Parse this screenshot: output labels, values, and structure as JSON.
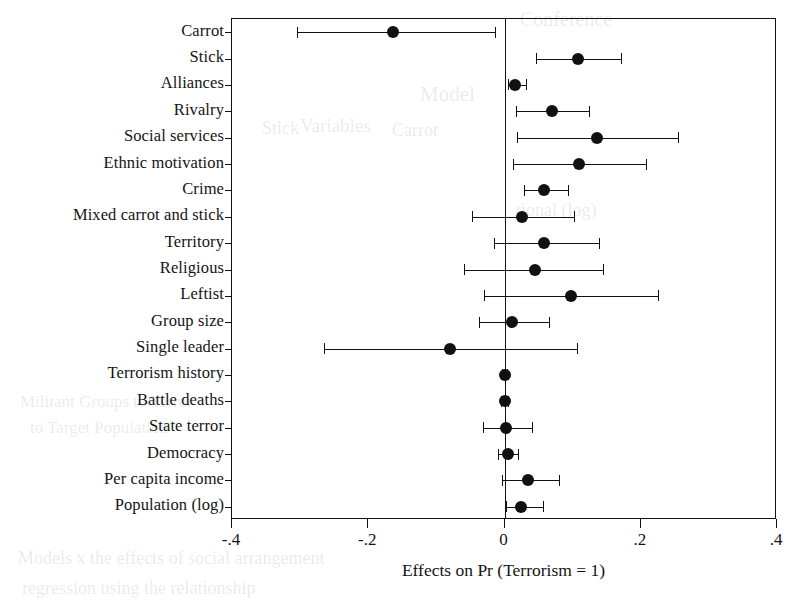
{
  "chart_data": {
    "type": "scatter",
    "title": "",
    "subtitle": "",
    "xlabel": "Effects on Pr (Terrorism = 1)",
    "ylabel": "",
    "xlim": [
      -0.4,
      0.4
    ],
    "xticks": [
      -0.4,
      -0.2,
      0,
      0.2,
      0.4
    ],
    "xticklabels": [
      "-.4",
      "-.2",
      "0",
      ".2",
      ".4"
    ],
    "grid": false,
    "legend": null,
    "reference_line": 0,
    "marker": "filled-circle",
    "error_bars": "95% confidence interval with end caps",
    "categories": [
      "Carrot",
      "Stick",
      "Alliances",
      "Rivalry",
      "Social services",
      "Ethnic motivation",
      "Crime",
      "Mixed carrot and stick",
      "Territory",
      "Religious",
      "Leftist",
      "Group size",
      "Single leader",
      "Terrorism history",
      "Battle deaths",
      "State terror",
      "Democracy",
      "Per capita income",
      "Population (log)"
    ],
    "values": [
      -0.163,
      0.108,
      0.016,
      0.07,
      0.136,
      0.11,
      0.058,
      0.025,
      0.058,
      0.045,
      0.097,
      0.011,
      -0.08,
      0.0,
      0.0,
      0.002,
      0.005,
      0.034,
      0.024
    ],
    "ci_low": [
      -0.305,
      0.046,
      0.005,
      0.017,
      0.018,
      0.012,
      0.029,
      -0.048,
      -0.015,
      -0.059,
      -0.03,
      -0.037,
      -0.265,
      -0.004,
      -0.005,
      -0.032,
      -0.009,
      -0.004,
      0.002
    ],
    "ci_high": [
      -0.014,
      0.171,
      0.032,
      0.124,
      0.255,
      0.207,
      0.093,
      0.102,
      0.138,
      0.144,
      0.225,
      0.065,
      0.107,
      0.004,
      0.005,
      0.04,
      0.02,
      0.08,
      0.057
    ],
    "points": [
      {
        "label": "Carrot",
        "value": -0.163,
        "ci_low": -0.305,
        "ci_high": -0.014
      },
      {
        "label": "Stick",
        "value": 0.108,
        "ci_low": 0.046,
        "ci_high": 0.171
      },
      {
        "label": "Alliances",
        "value": 0.016,
        "ci_low": 0.005,
        "ci_high": 0.032
      },
      {
        "label": "Rivalry",
        "value": 0.07,
        "ci_low": 0.017,
        "ci_high": 0.124
      },
      {
        "label": "Social services",
        "value": 0.136,
        "ci_low": 0.018,
        "ci_high": 0.255
      },
      {
        "label": "Ethnic motivation",
        "value": 0.11,
        "ci_low": 0.012,
        "ci_high": 0.207
      },
      {
        "label": "Crime",
        "value": 0.058,
        "ci_low": 0.029,
        "ci_high": 0.093
      },
      {
        "label": "Mixed carrot and stick",
        "value": 0.025,
        "ci_low": -0.048,
        "ci_high": 0.102
      },
      {
        "label": "Territory",
        "value": 0.058,
        "ci_low": -0.015,
        "ci_high": 0.138
      },
      {
        "label": "Religious",
        "value": 0.045,
        "ci_low": -0.059,
        "ci_high": 0.144
      },
      {
        "label": "Leftist",
        "value": 0.097,
        "ci_low": -0.03,
        "ci_high": 0.225
      },
      {
        "label": "Group size",
        "value": 0.011,
        "ci_low": -0.037,
        "ci_high": 0.065
      },
      {
        "label": "Single leader",
        "value": -0.08,
        "ci_low": -0.265,
        "ci_high": 0.107
      },
      {
        "label": "Terrorism history",
        "value": 0.0,
        "ci_low": -0.004,
        "ci_high": 0.004
      },
      {
        "label": "Battle deaths",
        "value": 0.0,
        "ci_low": -0.005,
        "ci_high": 0.005
      },
      {
        "label": "State terror",
        "value": 0.002,
        "ci_low": -0.032,
        "ci_high": 0.04
      },
      {
        "label": "Democracy",
        "value": 0.005,
        "ci_low": -0.009,
        "ci_high": 0.02
      },
      {
        "label": "Per capita income",
        "value": 0.034,
        "ci_low": -0.004,
        "ci_high": 0.08
      },
      {
        "label": "Population (log)",
        "value": 0.024,
        "ci_low": 0.002,
        "ci_high": 0.057
      }
    ]
  },
  "style": {
    "marker_color": "#111111",
    "line_color": "#111111",
    "frame_color": "#111111",
    "background": "#ffffff"
  },
  "bleed_through": [
    {
      "text": "Conference",
      "x": 520,
      "y": 8,
      "size": 20
    },
    {
      "text": "Model",
      "x": 420,
      "y": 82,
      "size": 21
    },
    {
      "text": "Variables",
      "x": 300,
      "y": 115,
      "size": 19
    },
    {
      "text": "Stick",
      "x": 262,
      "y": 118,
      "size": 18
    },
    {
      "text": "Carrot",
      "x": 392,
      "y": 120,
      "size": 18
    },
    {
      "text": "tional (log)",
      "x": 516,
      "y": 200,
      "size": 18
    },
    {
      "text": "Militant  Groups  to  Terror",
      "x": 20,
      "y": 392,
      "size": 17
    },
    {
      "text": "to  Target  Population",
      "x": 30,
      "y": 418,
      "size": 17
    },
    {
      "text": "Models    x    the effects of social arrangement",
      "x": 18,
      "y": 548,
      "size": 18
    },
    {
      "text": "regression  using  the  relationship",
      "x": 22,
      "y": 578,
      "size": 18
    }
  ]
}
